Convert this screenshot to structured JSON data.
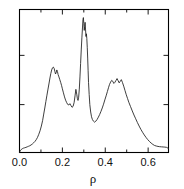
{
  "figure": {
    "background_color": "#ffffff",
    "line_color": "#1c1c1c",
    "axis_color": "#000000"
  },
  "chart_data": {
    "type": "line",
    "title": "",
    "subtitle": "",
    "xlabel": "ρ",
    "ylabel": "",
    "xlim": [
      0.0,
      0.695
    ],
    "ylim": [
      0.0,
      1.06
    ],
    "grid": false,
    "legend": null,
    "legend_position": "none",
    "x_ticks": [
      0.0,
      0.2,
      0.4,
      0.6
    ],
    "x_tick_labels": [
      "0.0",
      "0.2",
      "0.4",
      "0.6"
    ],
    "x_minor_ticks": [
      0.1,
      0.3,
      0.5
    ],
    "y_ticks": [
      0.0,
      0.355,
      0.72
    ],
    "y_tick_labels": [
      "",
      "",
      ""
    ],
    "annotations": [],
    "series": [
      {
        "name": "density",
        "x": [
          0.0,
          0.003,
          0.008,
          0.013,
          0.018,
          0.024,
          0.03,
          0.036,
          0.042,
          0.048,
          0.054,
          0.06,
          0.066,
          0.072,
          0.078,
          0.084,
          0.09,
          0.096,
          0.102,
          0.108,
          0.113,
          0.118,
          0.123,
          0.128,
          0.133,
          0.138,
          0.142,
          0.146,
          0.15,
          0.154,
          0.158,
          0.162,
          0.165,
          0.168,
          0.171,
          0.174,
          0.177,
          0.18,
          0.184,
          0.188,
          0.192,
          0.196,
          0.2,
          0.205,
          0.21,
          0.215,
          0.22,
          0.225,
          0.23,
          0.235,
          0.24,
          0.245,
          0.25,
          0.255,
          0.259,
          0.263,
          0.267,
          0.27,
          0.273,
          0.276,
          0.279,
          0.282,
          0.285,
          0.288,
          0.291,
          0.294,
          0.296,
          0.298,
          0.3,
          0.302,
          0.304,
          0.306,
          0.308,
          0.31,
          0.312,
          0.314,
          0.316,
          0.318,
          0.32,
          0.322,
          0.325,
          0.328,
          0.332,
          0.336,
          0.34,
          0.345,
          0.35,
          0.356,
          0.362,
          0.368,
          0.374,
          0.38,
          0.386,
          0.392,
          0.398,
          0.404,
          0.41,
          0.415,
          0.42,
          0.425,
          0.43,
          0.435,
          0.44,
          0.445,
          0.45,
          0.455,
          0.46,
          0.465,
          0.47,
          0.475,
          0.48,
          0.486,
          0.492,
          0.498,
          0.504,
          0.51,
          0.518,
          0.526,
          0.534,
          0.542,
          0.55,
          0.558,
          0.566,
          0.574,
          0.582,
          0.59,
          0.598,
          0.606,
          0.614,
          0.622,
          0.63,
          0.638,
          0.646,
          0.654,
          0.662,
          0.67,
          0.678,
          0.686,
          0.695
        ],
        "y": [
          0.0,
          0.012,
          0.022,
          0.028,
          0.032,
          0.035,
          0.038,
          0.042,
          0.046,
          0.05,
          0.056,
          0.063,
          0.072,
          0.082,
          0.095,
          0.112,
          0.135,
          0.162,
          0.196,
          0.238,
          0.285,
          0.33,
          0.378,
          0.425,
          0.47,
          0.515,
          0.552,
          0.585,
          0.612,
          0.628,
          0.633,
          0.622,
          0.6,
          0.582,
          0.592,
          0.612,
          0.6,
          0.578,
          0.56,
          0.54,
          0.52,
          0.498,
          0.472,
          0.442,
          0.412,
          0.388,
          0.37,
          0.356,
          0.352,
          0.362,
          0.348,
          0.335,
          0.342,
          0.372,
          0.42,
          0.468,
          0.432,
          0.4,
          0.386,
          0.41,
          0.47,
          0.56,
          0.66,
          0.76,
          0.85,
          0.93,
          0.985,
          1.0,
          0.955,
          0.905,
          0.935,
          0.965,
          0.915,
          0.86,
          0.88,
          0.845,
          0.78,
          0.7,
          0.61,
          0.52,
          0.43,
          0.355,
          0.3,
          0.265,
          0.245,
          0.232,
          0.225,
          0.232,
          0.245,
          0.262,
          0.282,
          0.305,
          0.33,
          0.358,
          0.39,
          0.42,
          0.452,
          0.48,
          0.505,
          0.522,
          0.535,
          0.528,
          0.512,
          0.52,
          0.534,
          0.548,
          0.532,
          0.516,
          0.528,
          0.54,
          0.52,
          0.492,
          0.46,
          0.428,
          0.4,
          0.372,
          0.34,
          0.308,
          0.278,
          0.25,
          0.222,
          0.196,
          0.172,
          0.15,
          0.13,
          0.112,
          0.096,
          0.082,
          0.07,
          0.06,
          0.052,
          0.048,
          0.045,
          0.043,
          0.042,
          0.041,
          0.04,
          0.038,
          0.03
        ]
      }
    ]
  }
}
